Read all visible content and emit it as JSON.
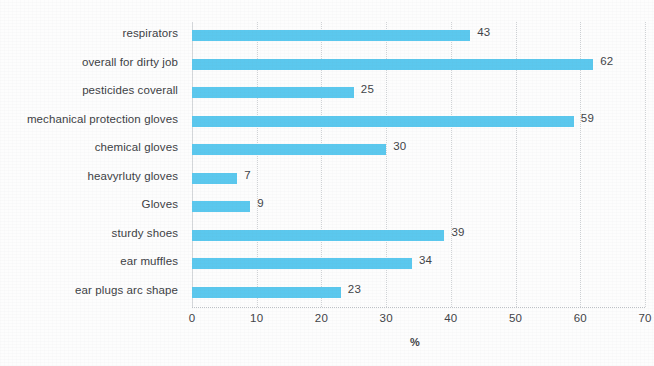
{
  "chart_data": {
    "type": "bar",
    "orientation": "horizontal",
    "title": "",
    "subtitle": "",
    "xlabel": "%",
    "ylabel": "",
    "xlim": [
      0,
      70
    ],
    "xticks": [
      0,
      10,
      20,
      30,
      40,
      50,
      60,
      70
    ],
    "grid": true,
    "grid_axis": "x",
    "legend": false,
    "legend_position": "none",
    "bar_color": "#5bc8ee",
    "text_color": "#3f4347",
    "background": "#ffffff",
    "categories": [
      "respirators",
      "overall for dirty job",
      "pesticides coverall",
      "mechanical protection gloves",
      "chemical gloves",
      "heavyrluty gloves",
      "Gloves",
      "sturdy shoes",
      "ear muffles",
      "ear plugs arc shape"
    ],
    "values": [
      43,
      62,
      25,
      59,
      30,
      7,
      9,
      39,
      34,
      23
    ],
    "value_labels": [
      "43",
      "62",
      "25",
      "59",
      "30",
      "7",
      "9",
      "39",
      "34",
      "23"
    ],
    "xtick_labels": [
      "0",
      "10",
      "20",
      "30",
      "40",
      "50",
      "60",
      "70"
    ]
  }
}
